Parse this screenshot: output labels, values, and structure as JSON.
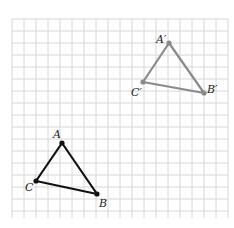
{
  "diagram": {
    "type": "translation-on-grid",
    "grid": {
      "x0": 12,
      "y0": 19,
      "x1": 228,
      "y1": 218,
      "spacing": 12,
      "color": "#d6d6d6"
    },
    "original": {
      "color": "#111111",
      "points": {
        "A": {
          "x": 62,
          "y": 143,
          "label": "A",
          "lx": 53,
          "ly": 138
        },
        "B": {
          "x": 97,
          "y": 194,
          "label": "B",
          "lx": 99,
          "ly": 207
        },
        "C": {
          "x": 36,
          "y": 181,
          "label": "C",
          "lx": 25,
          "ly": 191
        }
      }
    },
    "image": {
      "color": "#8a8a8a",
      "points": {
        "A'": {
          "x": 169,
          "y": 43,
          "label": "A′",
          "lx": 156,
          "ly": 43
        },
        "B'": {
          "x": 204,
          "y": 93,
          "label": "B′",
          "lx": 207,
          "ly": 93
        },
        "C'": {
          "x": 143,
          "y": 82,
          "label": "C′",
          "lx": 131,
          "ly": 96
        }
      }
    }
  }
}
